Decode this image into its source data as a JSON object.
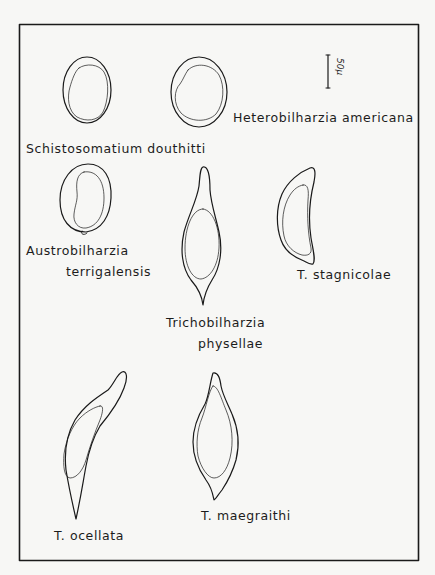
{
  "figure": {
    "scale_bar": {
      "label": "50μ"
    },
    "specimens": [
      {
        "id": "schistosomatium",
        "label": "Schistosomatium   douthitti"
      },
      {
        "id": "heterobilharzia",
        "label": "Heterobilharzia   americana"
      },
      {
        "id": "austrobilharzia",
        "label_line1": "Austrobilharzia",
        "label_line2": "terrigalensis"
      },
      {
        "id": "trichobilharzia-physellae",
        "label_line1": "Trichobilharzia",
        "label_line2": "physellae"
      },
      {
        "id": "t-stagnicolae",
        "label": "T.  stagnicolae"
      },
      {
        "id": "t-ocellata",
        "label": "T. ocellata"
      },
      {
        "id": "t-maegraithi",
        "label": "T.  maegraithi"
      }
    ]
  }
}
